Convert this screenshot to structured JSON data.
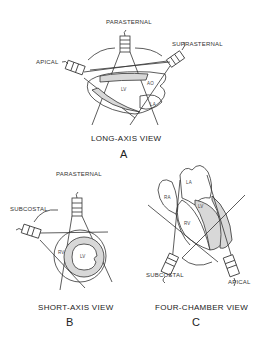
{
  "panels": {
    "a": {
      "letter": "A",
      "caption": "LONG-AXIS VIEW",
      "probes": {
        "parasternal": "PARASTERNAL",
        "suprasternal": "SUPRASTERNAL",
        "apical": "APICAL"
      },
      "chambers": {
        "lv": "LV",
        "ao": "AO",
        "la": "LA"
      }
    },
    "b": {
      "letter": "B",
      "caption": "SHORT-AXIS VIEW",
      "probes": {
        "parasternal": "PARASTERNAL",
        "subcostal": "SUBCOSTAL"
      },
      "chambers": {
        "rv": "RV",
        "lv": "LV"
      }
    },
    "c": {
      "letter": "C",
      "caption": "FOUR-CHAMBER VIEW",
      "probes": {
        "subcostal": "SUBCOSTAL",
        "apical": "APICAL"
      },
      "chambers": {
        "ra": "RA",
        "la": "LA",
        "lv": "LV",
        "rv": "RV"
      }
    }
  },
  "colors": {
    "line": "#333333",
    "fill": "#d8d8d8",
    "background": "#ffffff"
  }
}
